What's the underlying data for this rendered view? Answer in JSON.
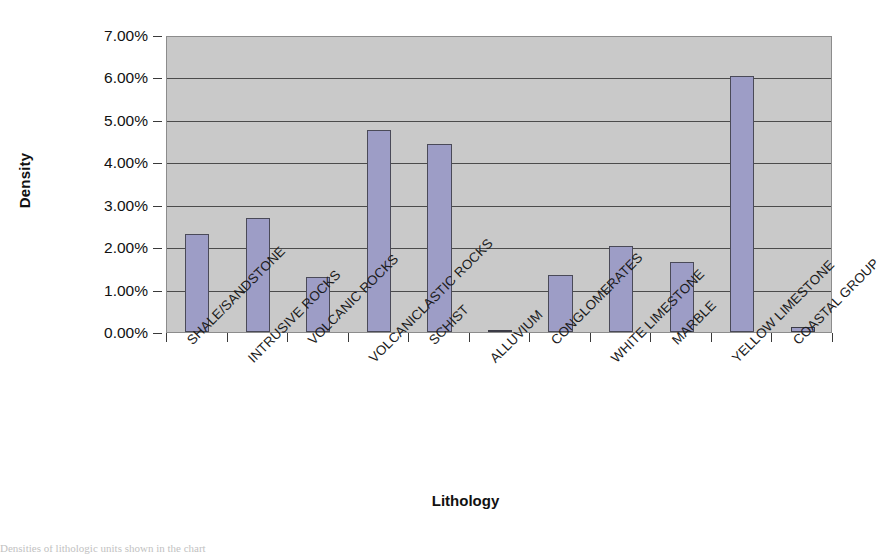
{
  "chart_data": {
    "type": "bar",
    "title": "",
    "xlabel": "Lithology",
    "ylabel": "Density",
    "categories": [
      "SHALE/SANDSTONE",
      "INTRUSIVE ROCKS",
      "VOLCANIC ROCKS",
      "VOLCANICLASTIC ROCKS",
      "SCHIST",
      "ALLUVIUM",
      "CONGLOMERATES",
      "WHITE LIMESTONE",
      "MARBLE",
      "YELLOW LIMESTONE",
      "COASTAL GROUP"
    ],
    "values": [
      2.3,
      2.68,
      1.3,
      4.77,
      4.43,
      0.03,
      1.35,
      2.03,
      1.64,
      6.03,
      0.12
    ],
    "value_unit": "%",
    "ylim": [
      0,
      7
    ],
    "ytick_values": [
      0,
      1,
      2,
      3,
      4,
      5,
      6,
      7
    ],
    "ytick_labels": [
      "0.00%",
      "1.00%",
      "2.00%",
      "3.00%",
      "4.00%",
      "5.00%",
      "6.00%",
      "7.00%"
    ],
    "grid": true,
    "legend": false,
    "series_count": 1,
    "colors": {
      "bar_fill": "#9d9dc6",
      "bar_border": "#4a4a58",
      "plot_background": "#c9c9c9",
      "gridline": "#4b4b4b",
      "axis": "#3a3a3a",
      "text": "#111111",
      "page_background": "#ffffff"
    }
  },
  "caption": {
    "text": "Densities of lithologic units shown in the chart"
  }
}
